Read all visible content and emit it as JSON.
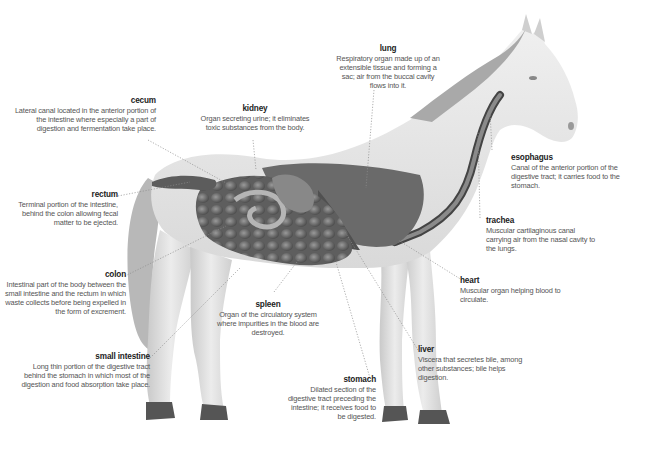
{
  "diagram": {
    "labels": [
      {
        "id": "cecum",
        "title": "cecum",
        "desc": "Lateral canal located in the anterior portion of the intestine where especially a part of digestion and fermentation take place."
      },
      {
        "id": "kidney",
        "title": "kidney",
        "desc": "Organ secreting urine; it eliminates toxic substances from the body."
      },
      {
        "id": "lung",
        "title": "lung",
        "desc": "Respiratory organ made up of an extensible tissue and forming a sac; air from the buccal cavity flows into it."
      },
      {
        "id": "esophagus",
        "title": "esophagus",
        "desc": "Canal of the anterior portion of the digestive tract; it carries food to the stomach."
      },
      {
        "id": "rectum",
        "title": "rectum",
        "desc": "Terminal portion of the intestine, behind the colon allowing fecal matter to be ejected."
      },
      {
        "id": "trachea",
        "title": "trachea",
        "desc": "Muscular cartilaginous canal carrying air from the nasal cavity to the lungs."
      },
      {
        "id": "colon",
        "title": "colon",
        "desc": "Intestinal part of the body between the small intestine and the rectum in which waste collects before being expelled in the form of excrement."
      },
      {
        "id": "heart",
        "title": "heart",
        "desc": "Muscular organ helping blood to circulate."
      },
      {
        "id": "spleen",
        "title": "spleen",
        "desc": "Organ of the circulatory system where impurities in the blood are destroyed."
      },
      {
        "id": "small_intestine",
        "title": "small intestine",
        "desc": "Long thin portion of the digestive tract behind the stomach in which most of the digestion and food absorption take place."
      },
      {
        "id": "liver",
        "title": "liver",
        "desc": "Viscera that secretes bile, among other substances; bile helps digestion."
      },
      {
        "id": "stomach",
        "title": "stomach",
        "desc": "Dilated section of the digestive tract preceding the intestine; it receives food to be digested."
      }
    ]
  },
  "colors": {
    "body": "#e6e6e6",
    "organ_dark": "#5a5a5a",
    "organ_mid": "#8a8a8a",
    "leader": "#8c8c8c",
    "title": "#222222",
    "text": "#555555"
  }
}
